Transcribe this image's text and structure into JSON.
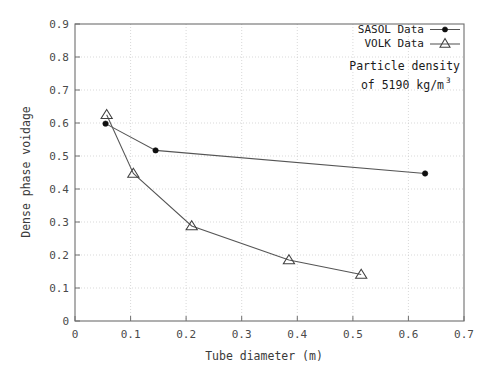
{
  "chart_data": {
    "type": "line",
    "title": "",
    "xlabel": "Tube diameter (m)",
    "ylabel": "Dense phase voidage",
    "xlim": [
      0,
      0.7
    ],
    "ylim": [
      0,
      0.9
    ],
    "xticks": [
      "0",
      "0.1",
      "0.2",
      "0.3",
      "0.4",
      "0.5",
      "0.6",
      "0.7"
    ],
    "xtick_values": [
      0,
      0.1,
      0.2,
      0.3,
      0.4,
      0.5,
      0.6,
      0.7
    ],
    "yticks": [
      "0",
      "0.1",
      "0.2",
      "0.3",
      "0.4",
      "0.5",
      "0.6",
      "0.7",
      "0.8",
      "0.9"
    ],
    "ytick_values": [
      0,
      0.1,
      0.2,
      0.3,
      0.4,
      0.5,
      0.6,
      0.7,
      0.8,
      0.9
    ],
    "grid": true,
    "legend_position": "top-right",
    "series": [
      {
        "name": "SASOL Data",
        "marker": "filled-circle",
        "x": [
          0.055,
          0.145,
          0.63
        ],
        "y": [
          0.598,
          0.517,
          0.447
        ]
      },
      {
        "name": "VOLK Data",
        "marker": "open-triangle",
        "x": [
          0.057,
          0.105,
          0.21,
          0.385,
          0.515
        ],
        "y": [
          0.625,
          0.447,
          0.288,
          0.185,
          0.141
        ]
      }
    ],
    "annotations": [
      {
        "line1": "Particle density",
        "line2_prefix": "of 5190 kg/m",
        "line2_sup": "3"
      }
    ]
  },
  "legend": {
    "items": [
      {
        "label": "SASOL Data",
        "marker": "filled-circle"
      },
      {
        "label": "VOLK Data",
        "marker": "open-triangle"
      }
    ]
  }
}
